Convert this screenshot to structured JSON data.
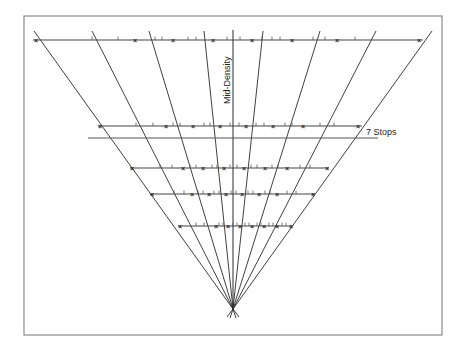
{
  "diagram": {
    "labels": {
      "axis": "Mid-Density",
      "range": "7 Stops"
    },
    "frame": {
      "x": 24,
      "y": 16,
      "w": 418,
      "h": 319,
      "color": "#8a8a8a"
    },
    "apex": {
      "x": 233,
      "y": 309
    },
    "line_color": "#2a2a2a",
    "axis_line": {
      "x": 233,
      "y1": 30,
      "y2": 309
    },
    "ray_tops": [
      {
        "x": 34,
        "y": 31
      },
      {
        "x": 92,
        "y": 31
      },
      {
        "x": 149,
        "y": 31
      },
      {
        "x": 204,
        "y": 31
      },
      {
        "x": 263,
        "y": 31
      },
      {
        "x": 320,
        "y": 31
      },
      {
        "x": 376,
        "y": 31
      },
      {
        "x": 432,
        "y": 31
      }
    ],
    "reference_line": {
      "x1": 88,
      "x2": 378,
      "y": 138
    },
    "rows": [
      {
        "y": 40,
        "x1": 33,
        "x2": 423,
        "marks": [
          36,
          135,
          173,
          213,
          252,
          292,
          337,
          419
        ],
        "ticks": [
          92,
          118,
          155,
          162,
          188,
          196,
          227,
          240,
          262,
          272,
          280,
          313,
          325,
          355
        ]
      },
      {
        "y": 126,
        "x1": 98,
        "x2": 362,
        "marks": [
          100,
          166,
          193,
          220,
          246,
          273,
          303,
          358
        ],
        "ticks": [
          136,
          153,
          173,
          180,
          204,
          210,
          230,
          239,
          256,
          264,
          285,
          292,
          320,
          334
        ]
      },
      {
        "y": 168,
        "x1": 130,
        "x2": 329,
        "marks": [
          132,
          183,
          203,
          224,
          244,
          265,
          287,
          327
        ],
        "ticks": [
          160,
          172,
          190,
          196,
          212,
          217,
          230,
          237,
          251,
          257,
          272,
          278,
          300,
          310
        ]
      },
      {
        "y": 194,
        "x1": 150,
        "x2": 315,
        "marks": [
          152,
          192,
          209,
          226,
          242,
          259,
          277,
          313
        ],
        "ticks": [
          174,
          184,
          198,
          203,
          214,
          219,
          231,
          236,
          248,
          253,
          265,
          270,
          287,
          296
        ]
      },
      {
        "y": 226,
        "x1": 178,
        "x2": 292,
        "marks": [
          180,
          216,
          228,
          240,
          252,
          264,
          277,
          291
        ],
        "ticks": [
          196,
          204,
          219,
          223,
          233,
          237,
          245,
          249,
          257,
          261,
          269,
          273,
          282,
          286
        ]
      }
    ]
  }
}
